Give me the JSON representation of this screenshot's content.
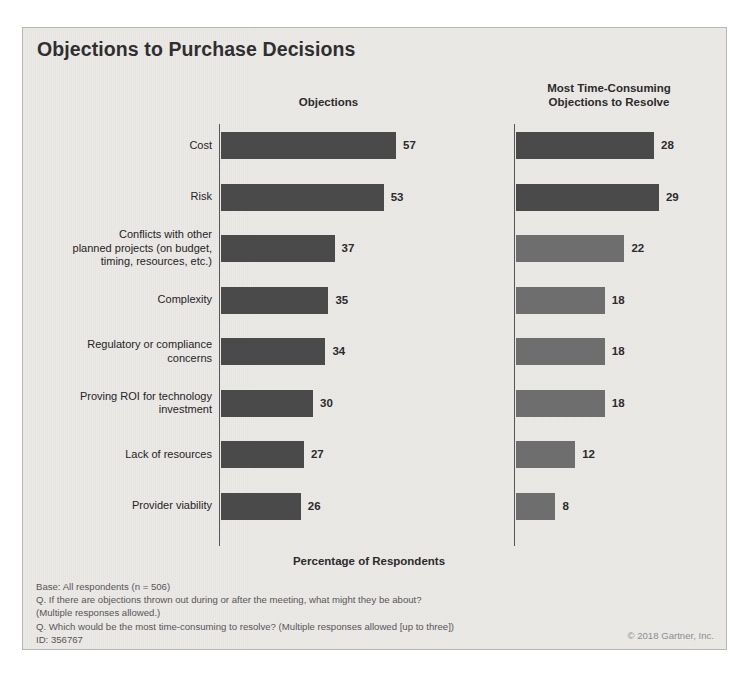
{
  "slide": {
    "title": "Objections to Purchase Decisions",
    "x_axis_caption": "Percentage of Respondents",
    "footnotes": [
      "Base: All respondents (n = 506)",
      "Q. If there are objections thrown out during or after the meeting, what might they be about?",
      "(Multiple responses allowed.)",
      "Q. Which would be the most time-consuming to resolve? (Multiple responses allowed [up to three])",
      "ID: 356767"
    ],
    "copyright": "© 2018 Gartner, Inc."
  },
  "colors": {
    "background": "#eceae7",
    "border": "#b9b6b2",
    "bar_dark": "#4a4a4a",
    "bar_medium": "#6e6e6e",
    "axis": "#575757",
    "title_text": "#2f2f2f",
    "label_text": "#242424",
    "footnote_text": "#565656",
    "copyright_text": "#8d8d8d"
  },
  "chart_data": {
    "type": "bar",
    "title": "Objections to Purchase Decisions",
    "xlabel": "Percentage of Respondents",
    "ylabel": "",
    "orientation": "horizontal",
    "grid": false,
    "legend": "none",
    "categories": [
      "Cost",
      "Risk",
      "Conflicts with other planned projects (on budget, timing, resources, etc.)",
      "Complexity",
      "Regulatory or compliance concerns",
      "Proving ROI for technology investment",
      "Lack of resources",
      "Provider viability"
    ],
    "series": [
      {
        "name": "Objections",
        "values": [
          57,
          53,
          37,
          35,
          34,
          30,
          27,
          26
        ],
        "xlim": [
          0,
          60
        ],
        "colors": [
          "#4a4a4a",
          "#4a4a4a",
          "#4a4a4a",
          "#4a4a4a",
          "#4a4a4a",
          "#4a4a4a",
          "#4a4a4a",
          "#4a4a4a"
        ]
      },
      {
        "name": "Most Time-Consuming Objections to Resolve",
        "values": [
          28,
          29,
          22,
          18,
          18,
          18,
          12,
          8
        ],
        "xlim": [
          0,
          30
        ],
        "colors": [
          "#4a4a4a",
          "#4a4a4a",
          "#6e6e6e",
          "#6e6e6e",
          "#6e6e6e",
          "#6e6e6e",
          "#6e6e6e",
          "#6e6e6e"
        ]
      }
    ]
  },
  "panels": {
    "left_header": "Objections",
    "right_header_line1": "Most Time-Consuming",
    "right_header_line2": "Objections to Resolve"
  },
  "category_lines": [
    [
      "Cost"
    ],
    [
      "Risk"
    ],
    [
      "Conflicts with other",
      "planned projects (on budget,",
      "timing, resources, etc.)"
    ],
    [
      "Complexity"
    ],
    [
      "Regulatory or compliance",
      "concerns"
    ],
    [
      "Proving ROI for technology",
      "investment"
    ],
    [
      "Lack of resources"
    ],
    [
      "Provider viability"
    ]
  ]
}
